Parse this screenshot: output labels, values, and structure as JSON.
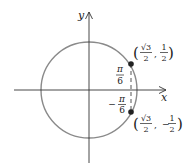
{
  "figure": {
    "type": "unit-circle-diagram",
    "axes": {
      "x_label": "x",
      "y_label": "y"
    },
    "circle": {
      "stroke_color": "#8a8a8a"
    },
    "points": [
      {
        "id": "upper",
        "angle_label_num": "π",
        "angle_label_den": "6",
        "angle_sign": "",
        "coord_x_num": "√3",
        "coord_x_den": "2",
        "coord_y_sign": "",
        "coord_y_num": "1",
        "coord_y_den": "2"
      },
      {
        "id": "lower",
        "angle_label_num": "π",
        "angle_label_den": "6",
        "angle_sign": "−",
        "coord_x_num": "√3",
        "coord_x_den": "2",
        "coord_y_sign": "−",
        "coord_y_num": "1",
        "coord_y_den": "2"
      }
    ],
    "colors": {
      "axis": "#333333",
      "circle": "#8a8a8a",
      "point": "#222222",
      "dashed": "#555555"
    }
  }
}
